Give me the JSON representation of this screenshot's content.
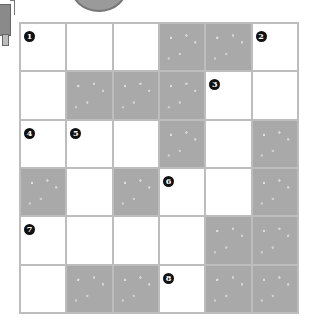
{
  "puzzle": {
    "rows": 6,
    "cols": 6,
    "colors": {
      "shaded": "#a9a9a9",
      "white": "#ffffff",
      "grid_line": "#bdbdbd",
      "number_badge": "#111111"
    },
    "cells": [
      [
        {
          "shaded": false,
          "num": "1"
        },
        {
          "shaded": false,
          "num": ""
        },
        {
          "shaded": false,
          "num": ""
        },
        {
          "shaded": true,
          "num": ""
        },
        {
          "shaded": true,
          "num": ""
        },
        {
          "shaded": false,
          "num": "2"
        }
      ],
      [
        {
          "shaded": false,
          "num": ""
        },
        {
          "shaded": true,
          "num": ""
        },
        {
          "shaded": true,
          "num": ""
        },
        {
          "shaded": true,
          "num": ""
        },
        {
          "shaded": false,
          "num": "3"
        },
        {
          "shaded": false,
          "num": ""
        }
      ],
      [
        {
          "shaded": false,
          "num": "4"
        },
        {
          "shaded": false,
          "num": "5"
        },
        {
          "shaded": false,
          "num": ""
        },
        {
          "shaded": true,
          "num": ""
        },
        {
          "shaded": false,
          "num": ""
        },
        {
          "shaded": true,
          "num": ""
        }
      ],
      [
        {
          "shaded": true,
          "num": ""
        },
        {
          "shaded": false,
          "num": ""
        },
        {
          "shaded": true,
          "num": ""
        },
        {
          "shaded": false,
          "num": "6"
        },
        {
          "shaded": false,
          "num": ""
        },
        {
          "shaded": true,
          "num": ""
        }
      ],
      [
        {
          "shaded": false,
          "num": "7"
        },
        {
          "shaded": false,
          "num": ""
        },
        {
          "shaded": false,
          "num": ""
        },
        {
          "shaded": false,
          "num": ""
        },
        {
          "shaded": true,
          "num": ""
        },
        {
          "shaded": true,
          "num": ""
        }
      ],
      [
        {
          "shaded": false,
          "num": ""
        },
        {
          "shaded": true,
          "num": ""
        },
        {
          "shaded": true,
          "num": ""
        },
        {
          "shaded": false,
          "num": "8"
        },
        {
          "shaded": true,
          "num": ""
        },
        {
          "shaded": true,
          "num": ""
        }
      ]
    ]
  },
  "decorations": {
    "left_figure": "partial-person-illustration",
    "top_figure": "partial-round-object-illustration"
  }
}
